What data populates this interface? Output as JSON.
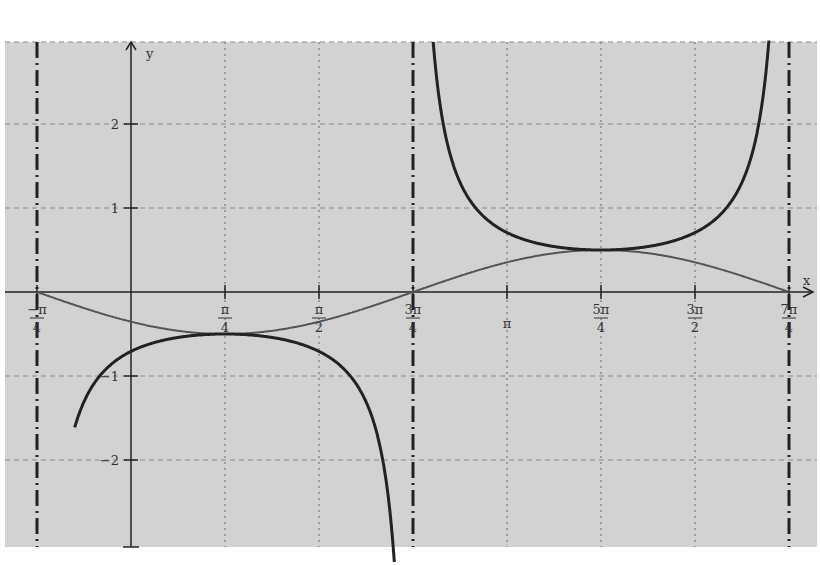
{
  "chart_data": {
    "type": "line",
    "title": "",
    "xlabel": "x",
    "ylabel": "y",
    "xlim": [
      -1.0,
      5.5
    ],
    "ylim": [
      -3.0,
      2.95
    ],
    "grid": true,
    "x_ticks": [
      {
        "value": -0.7854,
        "num": "−π",
        "den": "4"
      },
      {
        "value": 0.7854,
        "num": "π",
        "den": "4"
      },
      {
        "value": 1.5708,
        "num": "π",
        "den": "2"
      },
      {
        "value": 2.3562,
        "num": "3π",
        "den": "4"
      },
      {
        "value": 3.1416,
        "num": "π",
        "den": ""
      },
      {
        "value": 3.927,
        "num": "5π",
        "den": "4"
      },
      {
        "value": 4.7124,
        "num": "3π",
        "den": "2"
      },
      {
        "value": 5.4978,
        "num": "7π",
        "den": "4"
      }
    ],
    "y_ticks": [
      {
        "value": 2,
        "label": "2"
      },
      {
        "value": 1,
        "label": "1"
      },
      {
        "value": -1,
        "label": "−1"
      },
      {
        "value": -2,
        "label": "−2"
      }
    ],
    "asymptotes": [
      -0.7854,
      2.3562,
      5.4978
    ],
    "series": [
      {
        "name": "g(x) = -½·sin(x + π/4)",
        "style": "thin gray",
        "points": [
          [
            -0.7854,
            0
          ],
          [
            0,
            -0.354
          ],
          [
            0.7854,
            -0.5
          ],
          [
            1.5708,
            -0.354
          ],
          [
            2.3562,
            0
          ],
          [
            3.1416,
            0.354
          ],
          [
            3.927,
            0.5
          ],
          [
            4.7124,
            0.354
          ],
          [
            5.4978,
            0
          ]
        ]
      },
      {
        "name": "f(x) = -1/(2·sin(x + π/4))",
        "style": "thick dark",
        "points": [
          [
            -0.48,
            -2.9
          ],
          [
            0,
            -0.707
          ],
          [
            0.7854,
            -0.5
          ],
          [
            1.5708,
            -0.707
          ],
          [
            2.2,
            -3.0
          ],
          [
            2.58,
            2.8
          ],
          [
            3.1416,
            0.707
          ],
          [
            3.927,
            0.5
          ],
          [
            4.7124,
            0.707
          ],
          [
            5.3,
            2.75
          ]
        ]
      }
    ]
  },
  "axes": {
    "x_label": "x",
    "y_label": "y"
  }
}
